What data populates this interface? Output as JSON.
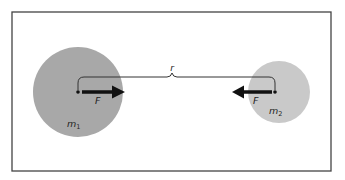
{
  "diagram": {
    "frame": {
      "x": 12,
      "y": 12,
      "width": 319,
      "height": 159,
      "stroke": "#444444"
    },
    "bodies": [
      {
        "id": "m1",
        "label": "m",
        "subscript": "1",
        "cx": 78,
        "cy": 92,
        "r": 45,
        "fill": "#a8a8a8",
        "label_x": 67,
        "label_y": 127
      },
      {
        "id": "m2",
        "label": "m",
        "subscript": "2",
        "cx": 279,
        "cy": 92,
        "r": 31,
        "fill": "#c9c9c9",
        "label_x": 269,
        "label_y": 114
      }
    ],
    "separation": {
      "label": "r",
      "label_x": 172,
      "label_y": 71,
      "x1": 78,
      "x2": 275,
      "y": 77
    },
    "forces": [
      {
        "id": "F-on-m1",
        "label": "F",
        "from_x": 82,
        "to_x": 124,
        "y": 92,
        "label_x": 95,
        "label_y": 104
      },
      {
        "id": "F-on-m2",
        "label": "F",
        "from_x": 272,
        "to_x": 232,
        "y": 92,
        "label_x": 253,
        "label_y": 104
      }
    ],
    "colors": {
      "arrow": "#111111",
      "bracket": "#333333",
      "dot": "#111111"
    }
  }
}
